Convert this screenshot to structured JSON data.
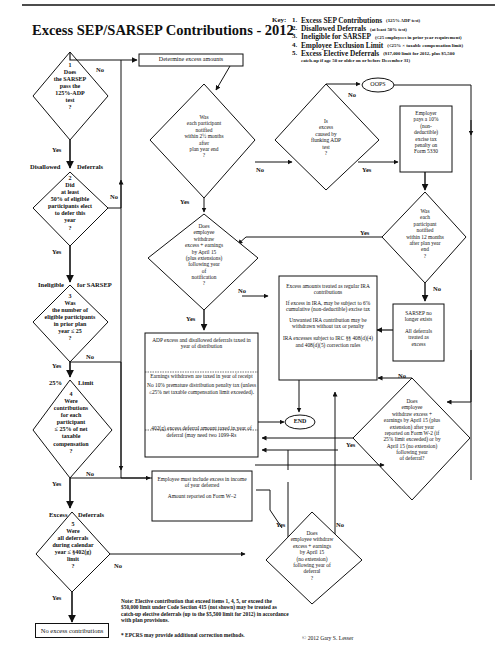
{
  "title": "Excess SEP/SARSEP Contributions - 2012",
  "key": {
    "label": "Key:",
    "items": [
      {
        "num": "1.",
        "name": "Excess SEP Contributions",
        "note": "(125% ADP test)"
      },
      {
        "num": "2.",
        "name": "Disallowed Deferrals",
        "note": "(at least 50% test)"
      },
      {
        "num": "3.",
        "name": "Ineligible for SARSEP",
        "note": "(≤25 employees in prior year requirement)"
      },
      {
        "num": "4.",
        "name": "Employee Exclusion Limit",
        "note": "(≤25% × taxable compensation limit)"
      },
      {
        "num": "5.",
        "name": "Excess Elective Deferrals",
        "note": "($17,000 limit for 2012, plus $5,500",
        "note2": "catch-up if age 50 or older on or before December 31)"
      }
    ]
  },
  "left_column": {
    "d1": {
      "num": "1",
      "lines": [
        "Does",
        "the SARSEP",
        "pass the",
        "125%-ADP",
        "test",
        "?"
      ]
    },
    "d2": {
      "num": "2",
      "header_left": "Disallowed",
      "header_right": "Deferrals",
      "lines": [
        "Did",
        "at least",
        "50% of eligible",
        "participants elect",
        "to defer this",
        "year",
        "?"
      ]
    },
    "d3": {
      "num": "3",
      "header_left": "Ineligible",
      "header_right": "for SARSEP",
      "lines": [
        "Was",
        "the number of",
        "eligible participants",
        "in prior plan",
        "year ≤ 25",
        "?"
      ]
    },
    "d4": {
      "num": "4",
      "header_left": "25%",
      "header_right": "Limit",
      "lines": [
        "Were",
        "contributions",
        "for each",
        "participant",
        "≤ 25% of net",
        "taxable",
        "compensation",
        "?"
      ]
    },
    "d5": {
      "num": "5",
      "header_left": "Excess",
      "header_right": "Deferrals",
      "lines": [
        "Were",
        "all deferrals",
        "during calendar",
        "year ≤ §402(g)",
        "limit",
        "?"
      ]
    },
    "end_box": "No excess contributions"
  },
  "nodes": {
    "determine": "Determine excess amounts",
    "notified_25": [
      "Was",
      "each participant",
      "notified",
      "within 2½ months",
      "after",
      "plan year end",
      "?"
    ],
    "flunking": [
      "Is",
      "excess",
      "caused by",
      "flunking ADP",
      "test",
      "?"
    ],
    "oops": "OOPS",
    "employer_penalty": [
      "Employer",
      "pays a 10%",
      "(non-",
      "deductible)",
      "excise tax",
      "penalty on",
      "Form 5330"
    ],
    "notified_12": [
      "Was",
      "each",
      "participant",
      "notified",
      "within 12 months",
      "after plan year",
      "end",
      "?"
    ],
    "withdraw_notification": [
      "Does",
      "employee",
      "withdraw",
      "excess + earnings",
      "by April 15",
      "(plus extensions)",
      "following year",
      "of",
      "notification",
      "?"
    ],
    "sarsep_gone": {
      "p1": [
        "SARSEP no",
        "longer exists"
      ],
      "p2": [
        "All deferrals",
        "treated as",
        "excess"
      ]
    },
    "ira_box": {
      "p1": "Excess amounts treated as regular IRA contributions",
      "p2": "If excess in IRA, may be subject to 6% cumulative (non-deductible) excise tax",
      "p3": "Unwanted IRA contribution may be withdrawn without tax or penalty",
      "p4": "IRA excesses subject to IRC §§ 408(d)(4) and 408(d)(5) correction rules"
    },
    "end": "END",
    "adp_box": {
      "p1": "ADP excess and disallowed deferrals taxed in year of distribution",
      "p2": "Earnings withdrawn are taxed in year of receipt",
      "p3": "No 10% premature distribution penalty tax (unless ≤25% net taxable compensation limit exceeded).",
      "p4": "402(g) excess deferral amount taxed in year of deferral (may need two 1099-Rs"
    },
    "withdraw_w2": [
      "Does",
      "employee",
      "withdraw excess +",
      "earnings by April 15 (plus",
      "extension) after year",
      "reported on Form W-2 (if",
      "25% limit exceeded) or by",
      "April 15 (no extension)",
      "following year",
      "of deferral?"
    ],
    "include_income": {
      "p1": "Employee must include excess in income of year deferred",
      "p2": "Amount reported on Form W–2"
    },
    "withdraw_noext": [
      "Does",
      "employee withdraw",
      "excess + earnings",
      "by April 15",
      "(no extension)",
      "following year of",
      "deferral",
      "?"
    ]
  },
  "edge_labels": {
    "yes": "Yes",
    "no": "No"
  },
  "footer": {
    "note": "Note: Elective contribution that exceed items 1, 4, 5, or exceed the $50,000 limit under Code Section 415 (not shown) may be treated as catch-up elective deferrals (up to the $5,500 limit for 2012) in accordance with plan provisions.",
    "epcrs": "* EPCRS may provide additional correction methods.",
    "copyright": "© 2012 Gary S. Lesser"
  }
}
